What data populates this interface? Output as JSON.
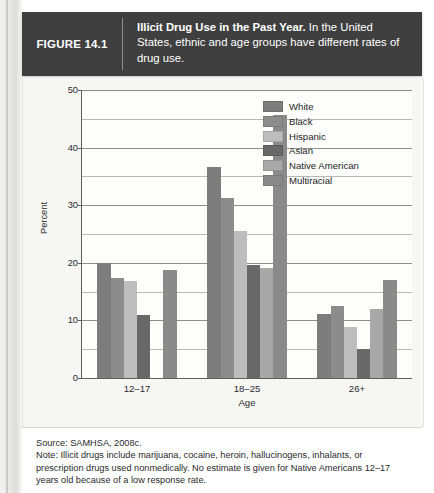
{
  "banner": {
    "figure_label": "FIGURE 14.1",
    "caption_bold": "Illicit Drug Use in the Past Year.",
    "caption_rest": " In the United States, ethnic and age groups have different rates of drug use."
  },
  "note": {
    "source": "Source: SAMHSA, 2008c.",
    "text": "Note: Illicit drugs include marijuana, cocaine, heroin, hallucinogens, inhalants, or prescription drugs used nonmedically. No estimate is given for Native Americans 12–17 years old because of a low response rate."
  },
  "chart_data": {
    "type": "bar",
    "title": "Illicit Drug Use in the Past Year",
    "xlabel": "Age",
    "ylabel": "Percent",
    "categories": [
      "12–17",
      "18–25",
      "26+"
    ],
    "ylim": [
      0,
      50
    ],
    "yticks": [
      0,
      10,
      20,
      30,
      40,
      50
    ],
    "ytick_labels": [
      "0",
      "10",
      "20",
      "30",
      "40",
      "50"
    ],
    "minor_gridlines": [
      5,
      15,
      25,
      35,
      45
    ],
    "grid": true,
    "legend_position": "top-right",
    "series": [
      {
        "name": "White",
        "color": "#7d7d7d",
        "values": [
          20.0,
          36.7,
          11.1
        ]
      },
      {
        "name": "Black",
        "color": "#8c8c8c",
        "values": [
          17.4,
          31.2,
          12.5
        ]
      },
      {
        "name": "Hispanic",
        "color": "#bdbdbd",
        "values": [
          16.8,
          25.6,
          8.8
        ]
      },
      {
        "name": "Asian",
        "color": "#686868",
        "values": [
          10.9,
          19.6,
          5.1
        ]
      },
      {
        "name": "Native American",
        "color": "#a8a8a8",
        "values": [
          null,
          19.1,
          12.0
        ]
      },
      {
        "name": "Multiracial",
        "color": "#8a8a8a",
        "values": [
          18.7,
          45.7,
          17.1
        ]
      }
    ]
  }
}
